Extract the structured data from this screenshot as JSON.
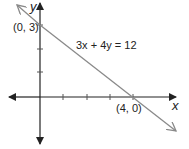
{
  "diagram": {
    "type": "line-graph",
    "equation": "3x + 4y = 12",
    "axes": {
      "x_label": "x",
      "y_label": "y"
    },
    "points": [
      {
        "label": "(0, 3)",
        "x": 0,
        "y": 3
      },
      {
        "label": "(4, 0)",
        "x": 4,
        "y": 0
      }
    ],
    "x_ticks": [
      1,
      2,
      3,
      4
    ],
    "y_ticks": [
      1,
      2,
      3
    ],
    "colors": {
      "axis": "#222222",
      "line": "#8a8a8a",
      "text": "#222222"
    }
  }
}
